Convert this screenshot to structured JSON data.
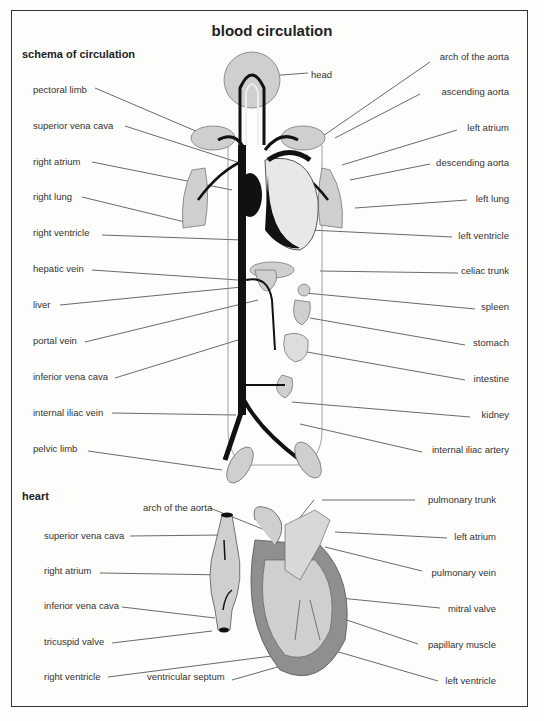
{
  "title": "blood circulation",
  "colors": {
    "organ_fill": "#cfcfcf",
    "heart_wall": "#8f8f8f",
    "vessel": "#111111",
    "line": "#444444",
    "frame": "#333333"
  },
  "schema": {
    "heading": "schema of circulation",
    "left_labels": [
      {
        "text": "pectoral limb",
        "x": 33,
        "y": 84
      },
      {
        "text": "superior vena cava",
        "x": 33,
        "y": 122
      },
      {
        "text": "right atrium",
        "x": 33,
        "y": 157
      },
      {
        "text": "right lung",
        "x": 33,
        "y": 192
      },
      {
        "text": "right ventricle",
        "x": 33,
        "y": 228
      },
      {
        "text": "hepatic vein",
        "x": 33,
        "y": 264
      },
      {
        "text": "liver",
        "x": 33,
        "y": 299
      },
      {
        "text": "portal vein",
        "x": 33,
        "y": 335
      },
      {
        "text": "inferior vena cava",
        "x": 33,
        "y": 372
      },
      {
        "text": "internal iliac vein",
        "x": 33,
        "y": 407
      },
      {
        "text": "pelvic limb",
        "x": 33,
        "y": 444
      }
    ],
    "right_labels": [
      {
        "text": "head",
        "x": 311,
        "y": 69
      },
      {
        "text": "arch of the aorta",
        "x": 509,
        "y": 56
      },
      {
        "text": "ascending aorta",
        "x": 509,
        "y": 88
      },
      {
        "text": "left atrium",
        "x": 509,
        "y": 124
      },
      {
        "text": "descending aorta",
        "x": 509,
        "y": 159
      },
      {
        "text": "left lung",
        "x": 509,
        "y": 195
      },
      {
        "text": "left ventricle",
        "x": 509,
        "y": 232
      },
      {
        "text": "celiac trunk",
        "x": 509,
        "y": 267
      },
      {
        "text": "spleen",
        "x": 509,
        "y": 303
      },
      {
        "text": "stomach",
        "x": 509,
        "y": 339
      },
      {
        "text": "intestine",
        "x": 509,
        "y": 375
      },
      {
        "text": "kidney",
        "x": 509,
        "y": 411
      },
      {
        "text": "internal iliac artery",
        "x": 509,
        "y": 446
      }
    ]
  },
  "heart": {
    "heading": "heart",
    "left_labels": [
      {
        "text": "arch of the aorta",
        "x": 143,
        "y": 502
      },
      {
        "text": "superior vena cava",
        "x": 44,
        "y": 530
      },
      {
        "text": "right atrium",
        "x": 44,
        "y": 565
      },
      {
        "text": "inferior vena cava",
        "x": 44,
        "y": 600
      },
      {
        "text": "tricuspid valve",
        "x": 44,
        "y": 636
      },
      {
        "text": "right ventricle",
        "x": 44,
        "y": 671
      },
      {
        "text": "ventricular septum",
        "x": 147,
        "y": 671
      }
    ],
    "right_labels": [
      {
        "text": "pulmonary trunk",
        "x": 496,
        "y": 494
      },
      {
        "text": "left atrium",
        "x": 496,
        "y": 531
      },
      {
        "text": "pulmonary vein",
        "x": 496,
        "y": 567
      },
      {
        "text": "mitral valve",
        "x": 496,
        "y": 603
      },
      {
        "text": "papillary muscle",
        "x": 496,
        "y": 639
      },
      {
        "text": "left ventricle",
        "x": 496,
        "y": 675
      }
    ]
  }
}
